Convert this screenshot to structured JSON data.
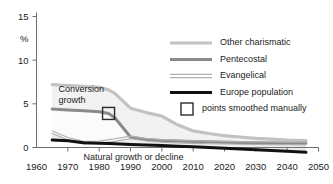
{
  "chart_data": {
    "type": "area",
    "title": "",
    "subtitle": "",
    "xlabel": "",
    "ylabel": "%",
    "xlim": [
      1960,
      2050
    ],
    "ylim": [
      -1,
      15
    ],
    "yticks": [
      0,
      5,
      10,
      15
    ],
    "ytick_labels": [
      "0",
      "5",
      "10",
      "15"
    ],
    "xticks": [
      1960,
      1970,
      1980,
      1990,
      2000,
      2010,
      2020,
      2030,
      2040,
      2050
    ],
    "xtick_labels": [
      "1960",
      "1970",
      "1980",
      "1990",
      "2000",
      "2010",
      "2020",
      "2030",
      "2040",
      "2050"
    ],
    "grid": false,
    "legend_position": "upper-right",
    "x": [
      1965,
      1970,
      1975,
      1980,
      1983,
      1985,
      1990,
      1995,
      2000,
      2005,
      2010,
      2015,
      2020,
      2025,
      2030,
      2035,
      2040,
      2046
    ],
    "series": [
      {
        "name": "Other charismatic",
        "color": "#c2c2c2",
        "values": [
          7.2,
          7.1,
          7.0,
          6.9,
          6.6,
          6.2,
          4.5,
          4.0,
          3.6,
          2.6,
          1.9,
          1.6,
          1.35,
          1.2,
          1.05,
          0.95,
          0.85,
          0.8
        ]
      },
      {
        "name": "Pentecostal",
        "color": "#8a8a8a",
        "values": [
          4.4,
          4.3,
          4.2,
          4.1,
          3.9,
          3.4,
          1.2,
          0.9,
          0.8,
          0.75,
          0.7,
          0.65,
          0.6,
          0.58,
          0.55,
          0.52,
          0.5,
          0.48
        ]
      },
      {
        "name": "Evangelical",
        "color": "#b0b0b0",
        "values": [
          1.75,
          1.0,
          0.55,
          0.6,
          0.75,
          0.85,
          1.15,
          0.9,
          0.75,
          0.68,
          0.62,
          0.58,
          0.55,
          0.52,
          0.5,
          0.48,
          0.46,
          0.45
        ]
      },
      {
        "name": "Europe population",
        "color": "#111111",
        "values": [
          0.85,
          0.78,
          0.55,
          0.5,
          0.45,
          0.42,
          0.35,
          0.28,
          0.22,
          0.15,
          0.08,
          0.0,
          -0.08,
          -0.16,
          -0.25,
          -0.34,
          -0.44,
          -0.55
        ]
      }
    ],
    "annotations": [
      {
        "id": "conversion-growth",
        "text_line1": "Conversion",
        "text_line2": "growth",
        "x": 1967,
        "y": 6.3
      },
      {
        "id": "natural-growth",
        "text": "Natural growth or decline",
        "x": 1975,
        "y": -0.6
      }
    ],
    "markers": [
      {
        "id": "smoothed-point",
        "x": 1983,
        "y": 3.9,
        "shape": "square"
      }
    ]
  },
  "legend": {
    "entries": [
      {
        "label": "Other charismatic",
        "style": "thick-light-gray"
      },
      {
        "label": "Pentecostal",
        "style": "thick-mid-gray"
      },
      {
        "label": "Evangelical",
        "style": "double-thin-gray"
      },
      {
        "label": "Europe population",
        "style": "thick-black"
      },
      {
        "label": "points smoothed manually",
        "style": "open-square"
      }
    ]
  },
  "colors": {
    "other_charismatic": "#c2c2c2",
    "pentecostal": "#8a8a8a",
    "evangelical": "#b0b0b0",
    "europe_population": "#111111",
    "band_fill": "#f2f2f2",
    "axis": "#6e6e6e",
    "text": "#1b1b1b"
  }
}
